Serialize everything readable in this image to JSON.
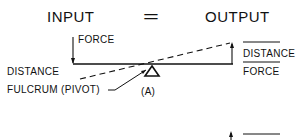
{
  "heading": {
    "input": "INPUT",
    "equals": "=",
    "output": "OUTPUT"
  },
  "labels": {
    "force_left": "FORCE",
    "distance_left": "DISTANCE",
    "fulcrum": "FULCRUM (PIVOT)",
    "figure_label": "(A)",
    "distance_right": "DISTANCE",
    "force_right": "FORCE"
  },
  "colors": {
    "ink": "#111111",
    "background": "#ffffff"
  }
}
